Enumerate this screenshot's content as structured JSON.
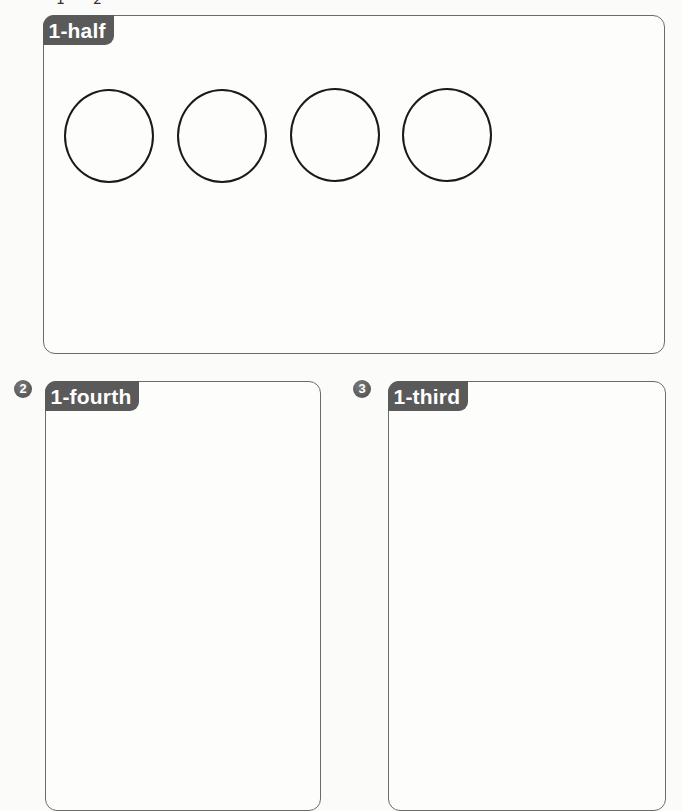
{
  "header_fragment": {
    "numerator": "1",
    "denominator": "2"
  },
  "sections": [
    {
      "number": "",
      "label": "1-half",
      "circles": 4
    },
    {
      "number": "2",
      "label": "1-fourth"
    },
    {
      "number": "3",
      "label": "1-third"
    }
  ],
  "colors": {
    "tab_background": "#5a5a5a",
    "tab_text": "#ffffff",
    "panel_border": "#6b6b6b",
    "circle_stroke": "#1a1a1a",
    "badge_background": "#5a5a5a"
  }
}
